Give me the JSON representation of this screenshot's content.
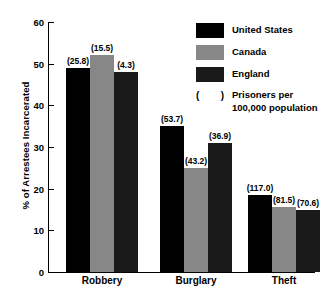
{
  "chart_data": {
    "type": "bar",
    "title": "",
    "subtitle": "",
    "xlabel": "",
    "ylabel": "% of Arrestees Incarcerated",
    "ylim": [
      0,
      60
    ],
    "yticks": [
      0,
      10,
      20,
      30,
      40,
      50,
      60
    ],
    "ytick_labels": [
      "0",
      "10",
      "20",
      "30",
      "40",
      "50",
      "60"
    ],
    "grid": false,
    "legend_position": "upper-right-inside",
    "categories": [
      "Robbery",
      "Burglary",
      "Theft"
    ],
    "series": [
      {
        "name": "United States",
        "color": "#000000",
        "values": [
          49.0,
          35.0,
          18.5
        ],
        "point_labels": [
          "(25.8)",
          "(53.7)",
          "(117.0)"
        ],
        "point_label_values": [
          25.8,
          53.7,
          117.0
        ]
      },
      {
        "name": "Canada",
        "color": "#878787",
        "values": [
          52.0,
          25.0,
          15.5
        ],
        "point_labels": [
          "(15.5)",
          "(43.2)",
          "(81.5)"
        ],
        "point_label_values": [
          15.5,
          43.2,
          81.5
        ]
      },
      {
        "name": "England",
        "color": "#1a1a1a",
        "values": [
          48.0,
          31.0,
          15.0
        ],
        "point_labels": [
          "(4.3)",
          "(36.9)",
          "(70.6)"
        ],
        "point_label_values": [
          4.3,
          36.9,
          70.6
        ]
      }
    ],
    "annotation": {
      "paren_open": "(",
      "paren_close": ")",
      "note_line1": "Prisoners per",
      "note_line2": "100,000 population"
    }
  }
}
